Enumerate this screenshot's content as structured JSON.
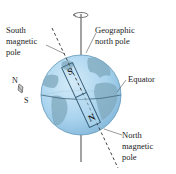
{
  "diagram": {
    "labels": {
      "south_magnetic_pole": [
        "South",
        "magnetic",
        "pole"
      ],
      "geographic_north_pole": [
        "Geographic",
        "north pole"
      ],
      "equator": "Equator",
      "north_magnetic_pole": [
        "North",
        "magnetic",
        "pole"
      ],
      "compass_n": "N",
      "compass_s": "S",
      "magnet_s": "S",
      "magnet_n": "N"
    },
    "colors": {
      "ocean": "#a9d3ee",
      "ocean_edge": "#5f97b8",
      "land": "#7fa8bd",
      "axis": "#666666",
      "text": "#222222"
    }
  }
}
